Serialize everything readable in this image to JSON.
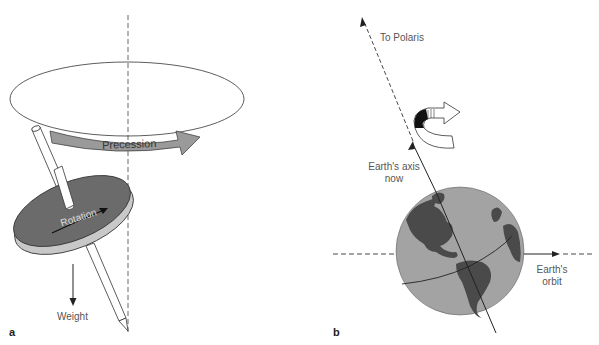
{
  "panels": [
    {
      "letter": "a",
      "title": "Spinning top precession",
      "labels": {
        "precession": "Precession",
        "rotation": "Rotation",
        "weight": "Weight"
      }
    },
    {
      "letter": "b",
      "title": "Earth axis precession",
      "labels": {
        "to_polaris": "To Polaris",
        "axis_now_line1": "Earth's axis",
        "axis_now_line2": "now",
        "orbit_line1": "Earth's",
        "orbit_line2": "orbit"
      }
    }
  ],
  "colors": {
    "disk_top": "#6b6b6b",
    "disk_edge": "#c8c8c8",
    "arrow_fill": "#9a9a9a",
    "earth_ocean": "#a3a3a3",
    "earth_land": "#4a4a4a",
    "line": "#222222"
  }
}
